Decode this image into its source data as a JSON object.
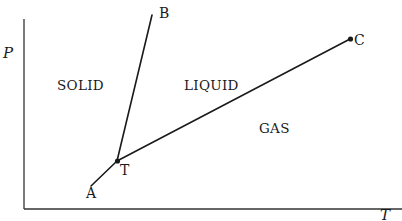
{
  "diagram": {
    "type": "phase-diagram",
    "axes": {
      "y_label": "P",
      "x_label": "T"
    },
    "regions": {
      "solid": "SOLID",
      "liquid": "LIQUID",
      "gas": "GAS"
    },
    "points": {
      "A": {
        "label": "A",
        "x": 100,
        "y": 185
      },
      "B": {
        "label": "B",
        "x": 152,
        "y": 14
      },
      "C": {
        "label": "C",
        "x": 350,
        "y": 39
      },
      "T": {
        "label": "T",
        "x": 117,
        "y": 161
      }
    },
    "curves": [
      {
        "name": "sublimation-curve",
        "from": "A",
        "to": "T"
      },
      {
        "name": "melting-curve",
        "from": "T",
        "to": "B"
      },
      {
        "name": "vaporization-curve",
        "from": "T",
        "to": "C"
      }
    ],
    "colors": {
      "line": "#1a1a1a",
      "background": "#ffffff"
    }
  }
}
